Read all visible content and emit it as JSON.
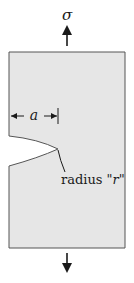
{
  "diagram": {
    "stress_label": "σ",
    "dimension_label": "a",
    "radius_label_prefix": "radius \"",
    "radius_symbol": "r",
    "radius_label_suffix": "\"",
    "colors": {
      "plate_fill": "#e6e6e6",
      "plate_stroke": "#555555",
      "ink": "#1a1a1a",
      "background": "#ffffff"
    }
  }
}
